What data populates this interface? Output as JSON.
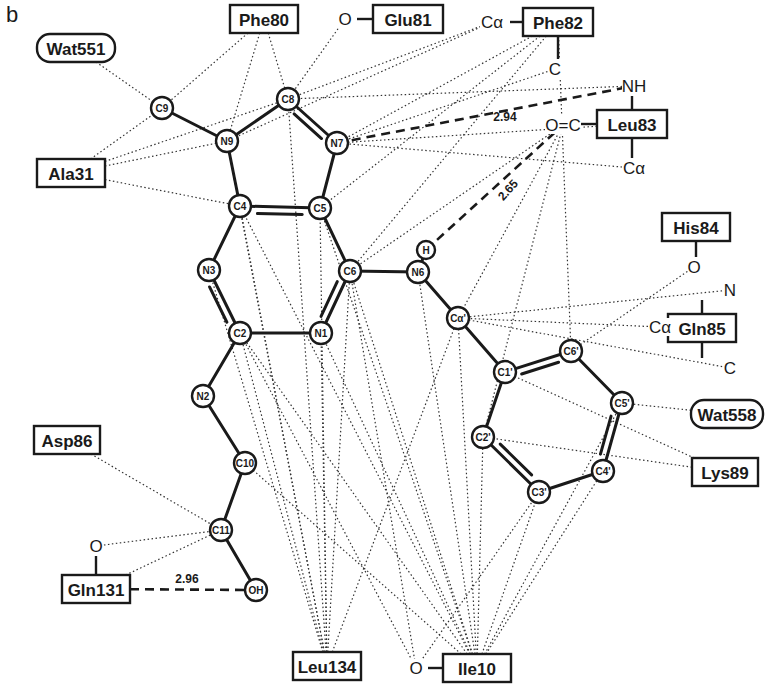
{
  "panel_label": "b",
  "atoms": [
    {
      "id": "C9",
      "label": "C9",
      "x": 162,
      "y": 108,
      "r": 11
    },
    {
      "id": "N9",
      "label": "N9",
      "x": 227,
      "y": 141,
      "r": 11
    },
    {
      "id": "C8",
      "label": "C8",
      "x": 288,
      "y": 99,
      "r": 11
    },
    {
      "id": "N7",
      "label": "N7",
      "x": 337,
      "y": 143,
      "r": 11
    },
    {
      "id": "C4",
      "label": "C4",
      "x": 240,
      "y": 206,
      "r": 11
    },
    {
      "id": "C5",
      "label": "C5",
      "x": 320,
      "y": 208,
      "r": 11
    },
    {
      "id": "N3",
      "label": "N3",
      "x": 209,
      "y": 270,
      "r": 11
    },
    {
      "id": "C6",
      "label": "C6",
      "x": 350,
      "y": 271,
      "r": 11
    },
    {
      "id": "N6",
      "label": "N6",
      "x": 418,
      "y": 272,
      "r": 11
    },
    {
      "id": "H",
      "label": "H",
      "x": 426,
      "y": 250,
      "r": 9
    },
    {
      "id": "C2",
      "label": "C2",
      "x": 240,
      "y": 333,
      "r": 11
    },
    {
      "id": "N1",
      "label": "N1",
      "x": 321,
      "y": 333,
      "r": 11
    },
    {
      "id": "Ca'",
      "label": "Cα'",
      "x": 458,
      "y": 318,
      "r": 11
    },
    {
      "id": "C1'",
      "label": "C1'",
      "x": 505,
      "y": 372,
      "r": 11
    },
    {
      "id": "C6'",
      "label": "C6'",
      "x": 571,
      "y": 351,
      "r": 11
    },
    {
      "id": "C5'",
      "label": "C5'",
      "x": 622,
      "y": 403,
      "r": 11
    },
    {
      "id": "C2'",
      "label": "C2'",
      "x": 483,
      "y": 437,
      "r": 11
    },
    {
      "id": "C4'",
      "label": "C4'",
      "x": 603,
      "y": 471,
      "r": 11
    },
    {
      "id": "C3'",
      "label": "C3'",
      "x": 539,
      "y": 492,
      "r": 11
    },
    {
      "id": "N2",
      "label": "N2",
      "x": 203,
      "y": 396,
      "r": 11
    },
    {
      "id": "C10",
      "label": "C10",
      "x": 245,
      "y": 463,
      "r": 11
    },
    {
      "id": "C11",
      "label": "C11",
      "x": 221,
      "y": 530,
      "r": 11
    },
    {
      "id": "OH",
      "label": "OH",
      "x": 256,
      "y": 590,
      "r": 11
    }
  ],
  "bonds": [
    {
      "a": "C9",
      "b": "N9",
      "order": 1
    },
    {
      "a": "N9",
      "b": "C8",
      "order": 1
    },
    {
      "a": "C8",
      "b": "N7",
      "order": 2
    },
    {
      "a": "N7",
      "b": "C5",
      "order": 1
    },
    {
      "a": "N9",
      "b": "C4",
      "order": 1
    },
    {
      "a": "C4",
      "b": "C5",
      "order": 2
    },
    {
      "a": "C4",
      "b": "N3",
      "order": 1
    },
    {
      "a": "N3",
      "b": "C2",
      "order": 2
    },
    {
      "a": "C5",
      "b": "C6",
      "order": 1
    },
    {
      "a": "C6",
      "b": "N1",
      "order": 2
    },
    {
      "a": "C2",
      "b": "N1",
      "order": 1
    },
    {
      "a": "C6",
      "b": "N6",
      "order": 1
    },
    {
      "a": "N6",
      "b": "H",
      "order": 1
    },
    {
      "a": "N6",
      "b": "Ca'",
      "order": 1
    },
    {
      "a": "Ca'",
      "b": "C1'",
      "order": 1
    },
    {
      "a": "C1'",
      "b": "C6'",
      "order": 2
    },
    {
      "a": "C6'",
      "b": "C5'",
      "order": 1
    },
    {
      "a": "C5'",
      "b": "C4'",
      "order": 2
    },
    {
      "a": "C4'",
      "b": "C3'",
      "order": 1
    },
    {
      "a": "C3'",
      "b": "C2'",
      "order": 2
    },
    {
      "a": "C2'",
      "b": "C1'",
      "order": 1
    },
    {
      "a": "C2",
      "b": "N2",
      "order": 1
    },
    {
      "a": "N2",
      "b": "C10",
      "order": 1
    },
    {
      "a": "C10",
      "b": "C11",
      "order": 1
    },
    {
      "a": "C11",
      "b": "OH",
      "order": 1
    }
  ],
  "residues": [
    {
      "id": "Wat551",
      "label": "Wat551",
      "x": 76,
      "y": 48,
      "w": 78,
      "h": 28,
      "shape": "rounded"
    },
    {
      "id": "Phe80",
      "label": "Phe80",
      "x": 264,
      "y": 19,
      "w": 68,
      "h": 28,
      "shape": "box"
    },
    {
      "id": "Glu81",
      "label": "Glu81",
      "x": 408,
      "y": 19,
      "w": 70,
      "h": 28,
      "shape": "box"
    },
    {
      "id": "Phe82",
      "label": "Phe82",
      "x": 558,
      "y": 22,
      "w": 70,
      "h": 28,
      "shape": "box"
    },
    {
      "id": "Leu83",
      "label": "Leu83",
      "x": 632,
      "y": 124,
      "w": 70,
      "h": 28,
      "shape": "box"
    },
    {
      "id": "Ala31",
      "label": "Ala31",
      "x": 71,
      "y": 173,
      "w": 68,
      "h": 28,
      "shape": "box"
    },
    {
      "id": "His84",
      "label": "His84",
      "x": 696,
      "y": 227,
      "w": 68,
      "h": 28,
      "shape": "box"
    },
    {
      "id": "Gln85",
      "label": "Gln85",
      "x": 702,
      "y": 328,
      "w": 68,
      "h": 28,
      "shape": "box"
    },
    {
      "id": "Wat558",
      "label": "Wat558",
      "x": 727,
      "y": 414,
      "w": 72,
      "h": 28,
      "shape": "rounded"
    },
    {
      "id": "Asp86",
      "label": "Asp86",
      "x": 67,
      "y": 440,
      "w": 66,
      "h": 28,
      "shape": "box"
    },
    {
      "id": "Lys89",
      "label": "Lys89",
      "x": 725,
      "y": 472,
      "w": 66,
      "h": 28,
      "shape": "box"
    },
    {
      "id": "Gln131",
      "label": "Gln131",
      "x": 96,
      "y": 589,
      "w": 68,
      "h": 28,
      "shape": "box"
    },
    {
      "id": "Leu134",
      "label": "Leu134",
      "x": 327,
      "y": 666,
      "w": 68,
      "h": 28,
      "shape": "box"
    },
    {
      "id": "Ile10",
      "label": "Ile10",
      "x": 477,
      "y": 668,
      "w": 68,
      "h": 28,
      "shape": "box"
    }
  ],
  "backbone_atoms": [
    {
      "id": "Glu81_O",
      "label": "O",
      "x": 345,
      "y": 19,
      "attach": "Glu81",
      "side": "left"
    },
    {
      "id": "Phe82_Ca",
      "label": "Cα",
      "x": 492,
      "y": 22,
      "attach": "Phe82",
      "side": "left"
    },
    {
      "id": "Phe82_C",
      "label": "C",
      "x": 555,
      "y": 69,
      "attach": "Phe82",
      "side": "bottom"
    },
    {
      "id": "Leu83_NH",
      "label": "NH",
      "x": 634,
      "y": 86,
      "attach": "Leu83",
      "side": "top"
    },
    {
      "id": "Leu83_OC",
      "label": "O=C",
      "x": 563,
      "y": 125,
      "attach": "Leu83",
      "side": "left"
    },
    {
      "id": "Leu83_Ca",
      "label": "Cα",
      "x": 634,
      "y": 168,
      "attach": "Leu83",
      "side": "bottom"
    },
    {
      "id": "His84_O",
      "label": "O",
      "x": 694,
      "y": 267,
      "attach": "His84",
      "side": "bottom"
    },
    {
      "id": "Gln85_N",
      "label": "N",
      "x": 730,
      "y": 290,
      "attach": "Gln85",
      "side": "top"
    },
    {
      "id": "Gln85_Ca",
      "label": "Cα",
      "x": 660,
      "y": 327,
      "attach": "Gln85",
      "side": "left"
    },
    {
      "id": "Gln85_C",
      "label": "C",
      "x": 730,
      "y": 368,
      "attach": "Gln85",
      "side": "bottom"
    },
    {
      "id": "Gln131_O",
      "label": "O",
      "x": 96,
      "y": 546,
      "attach": "Gln131",
      "side": "top"
    },
    {
      "id": "Ile10_O",
      "label": "O",
      "x": 416,
      "y": 668,
      "attach": "Ile10",
      "side": "left"
    }
  ],
  "hbonds": [
    {
      "from": "N7",
      "to": "Leu83_NH",
      "distance": "2.94",
      "label_x": 505,
      "label_y": 117,
      "angle": 0
    },
    {
      "from": "H",
      "to": "Leu83_OC",
      "distance": "2.65",
      "label_x": 508,
      "label_y": 190,
      "angle": -48
    },
    {
      "from": "Gln131",
      "to": "OH",
      "distance": "2.96",
      "label_x": 187,
      "label_y": 579,
      "angle": 0
    }
  ],
  "contacts": [
    [
      "Wat551",
      "C9"
    ],
    [
      "Phe80",
      "C9"
    ],
    [
      "Phe80",
      "N9"
    ],
    [
      "Phe80",
      "C8"
    ],
    [
      "Glu81_O",
      "C8"
    ],
    [
      "Phe82_Ca",
      "C8"
    ],
    [
      "Phe82_Ca",
      "N9"
    ],
    [
      "Phe82",
      "N7"
    ],
    [
      "Phe82",
      "C5"
    ],
    [
      "Phe82",
      "C6"
    ],
    [
      "Phe82",
      "C6'"
    ],
    [
      "Phe82_C",
      "N7"
    ],
    [
      "Leu83_NH",
      "C8"
    ],
    [
      "Leu83",
      "N7"
    ],
    [
      "Leu83_Ca",
      "N7"
    ],
    [
      "Leu83_OC",
      "C6"
    ],
    [
      "Leu83_OC",
      "Ca'"
    ],
    [
      "Leu83_OC",
      "C2'"
    ],
    [
      "Ala31",
      "C9"
    ],
    [
      "Ala31",
      "N9"
    ],
    [
      "Ala31",
      "C8"
    ],
    [
      "Ala31",
      "C4"
    ],
    [
      "His84_O",
      "C6'"
    ],
    [
      "Gln85_N",
      "Ca'"
    ],
    [
      "Gln85_Ca",
      "Ca'"
    ],
    [
      "Gln85_C",
      "Ca'"
    ],
    [
      "Wat558",
      "C5'"
    ],
    [
      "Lys89",
      "C1'"
    ],
    [
      "Lys89",
      "C2'"
    ],
    [
      "Asp86",
      "C11"
    ],
    [
      "Gln131_O",
      "C11"
    ],
    [
      "Gln131",
      "C11"
    ],
    [
      "Leu134",
      "N9"
    ],
    [
      "Leu134",
      "C8"
    ],
    [
      "Leu134",
      "C4"
    ],
    [
      "Leu134",
      "C5"
    ],
    [
      "Leu134",
      "N1"
    ],
    [
      "Leu134",
      "C6"
    ],
    [
      "Leu134",
      "C2"
    ],
    [
      "Leu134",
      "N3"
    ],
    [
      "Leu134",
      "Ca'"
    ],
    [
      "Ile10_O",
      "C6"
    ],
    [
      "Ile10_O",
      "C2"
    ],
    [
      "Ile10_O",
      "C3'"
    ],
    [
      "Ile10",
      "C4"
    ],
    [
      "Ile10",
      "C5"
    ],
    [
      "Ile10",
      "N1"
    ],
    [
      "Ile10",
      "C2"
    ],
    [
      "Ile10",
      "C10"
    ],
    [
      "Ile10",
      "N6"
    ],
    [
      "Ile10",
      "Ca'"
    ],
    [
      "Ile10",
      "C2'"
    ],
    [
      "Ile10",
      "C3'"
    ],
    [
      "Ile10",
      "C4'"
    ],
    [
      "Ile10",
      "C5'"
    ],
    [
      "Ile10",
      "C6"
    ]
  ]
}
